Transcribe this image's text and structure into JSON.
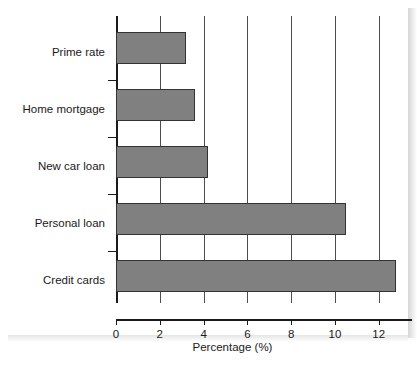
{
  "chart_data": {
    "type": "bar",
    "orientation": "horizontal",
    "title": "",
    "subtitle": "",
    "xlabel": "Percentage (%)",
    "ylabel": "",
    "categories": [
      "Prime rate",
      "Home mortgage",
      "New car loan",
      "Personal loan",
      "Credit cards"
    ],
    "values": [
      3.2,
      3.6,
      4.2,
      10.5,
      12.8
    ],
    "series": [
      {
        "name": "Percentage",
        "values": [
          3.2,
          3.6,
          4.2,
          10.5,
          12.8
        ]
      }
    ],
    "xlim": [
      0,
      13.7
    ],
    "xticks": [
      0,
      2,
      4,
      6,
      8,
      10,
      12
    ],
    "xtick_labels": [
      "0",
      "2",
      "4",
      "6",
      "8",
      "10",
      "12"
    ],
    "grid": "vertical",
    "legend": "none",
    "bar_color": "#808080",
    "bar_edge_color": "#333333",
    "axis_color": "#1a1a1a",
    "gridline_color": "#4d4d4d",
    "background": "#ffffff"
  }
}
